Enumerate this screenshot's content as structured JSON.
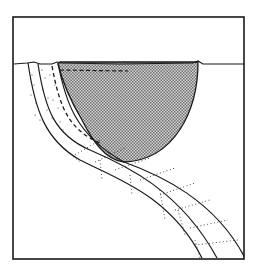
{
  "diagram": {
    "type": "schematic cross-section",
    "labels": [],
    "colors": {
      "background": "#ffffff",
      "line": "#1a1a1a",
      "shade_light": "#ffffff",
      "shade_dark": "#8a8a8a"
    },
    "frame": {
      "x": 13,
      "y": 17,
      "width": 231,
      "height": 242
    },
    "surface_line_y": 63,
    "shaded_body": {
      "left_x": 58,
      "right_x": 198,
      "top_y": 63,
      "bottom_y": 162
    },
    "dashed_line": {
      "x1": 60,
      "y1": 70,
      "x2": 128,
      "y2": 70
    }
  }
}
